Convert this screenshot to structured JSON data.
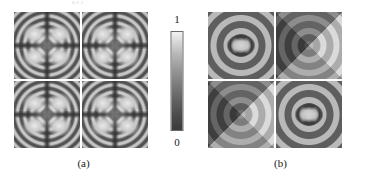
{
  "figure": {
    "header_artifact": "8.2.3",
    "subfigures": [
      {
        "id": "a",
        "caption": "(a)",
        "quantity": "intensity",
        "panels": [
          {
            "position": "top-left",
            "pattern": "four-lobe-diffraction"
          },
          {
            "position": "top-right",
            "pattern": "four-lobe-diffraction"
          },
          {
            "position": "bottom-left",
            "pattern": "four-lobe-diffraction"
          },
          {
            "position": "bottom-right",
            "pattern": "four-lobe-diffraction"
          }
        ],
        "colorbar": {
          "max_label": "1",
          "min_label": "0",
          "scale": "grayscale"
        }
      },
      {
        "id": "b",
        "caption": "(b)",
        "quantity": "phase",
        "panels": [
          {
            "position": "top-left",
            "pattern": "bowtie-rings"
          },
          {
            "position": "top-right",
            "pattern": "checkerboard-rings"
          },
          {
            "position": "bottom-left",
            "pattern": "checkerboard-rings"
          },
          {
            "position": "bottom-right",
            "pattern": "bowtie-rings"
          }
        ],
        "colorbar": {
          "max_label": "π",
          "min_label": "−π",
          "scale": "cyclic-grayscale"
        }
      }
    ]
  },
  "chart_data": {
    "type": "heatmap",
    "title": "",
    "xlabel": "",
    "ylabel": "",
    "panel_layout": "2x2 grid per subfigure",
    "subplots": [
      {
        "subfigure": "a",
        "label": "(a)",
        "quantity": "Intensity",
        "colormap": "gray",
        "colorbar_ticks": [
          "0",
          "1"
        ],
        "clim": [
          0,
          1
        ],
        "features": "concentric interference rings with four bright lobes and a dark central cross",
        "panels": [
          "four-lobe-diffraction",
          "four-lobe-diffraction",
          "four-lobe-diffraction",
          "four-lobe-diffraction"
        ]
      },
      {
        "subfigure": "b",
        "label": "(b)",
        "quantity": "Phase",
        "colormap": "gray-cyclic",
        "colorbar_ticks": [
          "−π",
          "π"
        ],
        "clim": [
          -3.141592653589793,
          3.141592653589793
        ],
        "features": "concentric phase bands; bowtie core on the main diagonal, quadrant checkerboard on the anti-diagonal",
        "panels": [
          "bowtie-rings",
          "checkerboard-rings",
          "checkerboard-rings",
          "bowtie-rings"
        ]
      }
    ],
    "grid": false,
    "legend": "colorbar-right-of-each-subfigure"
  }
}
